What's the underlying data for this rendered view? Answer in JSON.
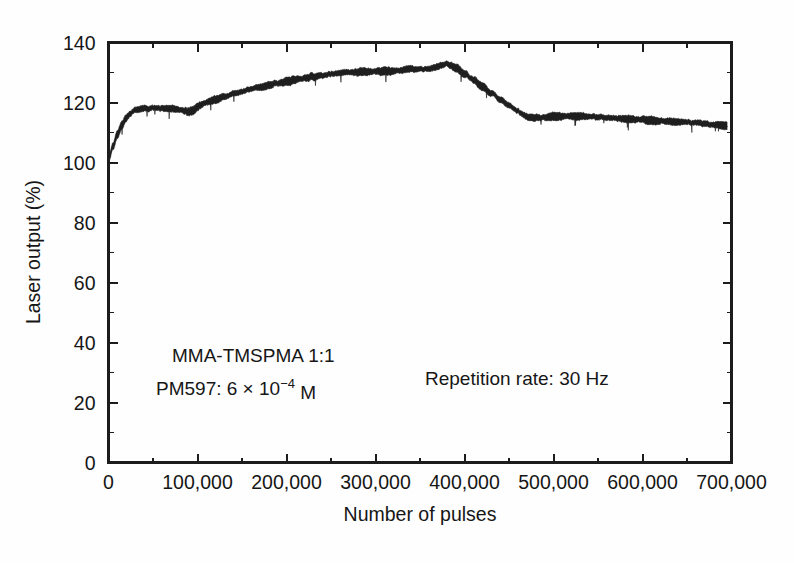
{
  "figure": {
    "background_color": "#fefefe",
    "ink_color": "#1c1c1c"
  },
  "chart_data": {
    "type": "line",
    "title": "",
    "xlabel": "Number of pulses",
    "ylabel": "Laser output (%)",
    "xlim": [
      0,
      700000
    ],
    "ylim": [
      0,
      140
    ],
    "grid": false,
    "legend": null,
    "x_ticks": [
      0,
      100000,
      200000,
      300000,
      400000,
      500000,
      600000,
      700000
    ],
    "x_tick_labels": [
      "0",
      "100,000",
      "200,000",
      "300,000",
      "400,000",
      "500,000",
      "600,000",
      "700,000"
    ],
    "x_minor_tick_step": 50000,
    "y_ticks": [
      0,
      20,
      40,
      60,
      80,
      100,
      120,
      140
    ],
    "y_tick_labels": [
      "0",
      "20",
      "40",
      "60",
      "80",
      "100",
      "120",
      "140"
    ],
    "y_minor_tick_step": 10,
    "series": [
      {
        "name": "Laser output vs pulses",
        "color": "#1f1f1f",
        "noise_amplitude": 1.4,
        "x": [
          0,
          5000,
          10000,
          15000,
          20000,
          25000,
          30000,
          40000,
          50000,
          60000,
          70000,
          80000,
          85000,
          90000,
          95000,
          100000,
          105000,
          110000,
          120000,
          130000,
          140000,
          150000,
          160000,
          170000,
          180000,
          190000,
          200000,
          210000,
          220000,
          230000,
          240000,
          250000,
          260000,
          270000,
          280000,
          290000,
          300000,
          310000,
          320000,
          330000,
          340000,
          350000,
          360000,
          370000,
          375000,
          380000,
          385000,
          390000,
          400000,
          410000,
          420000,
          430000,
          440000,
          450000,
          460000,
          465000,
          470000,
          480000,
          490000,
          500000,
          510000,
          520000,
          530000,
          540000,
          550000,
          560000,
          570000,
          580000,
          590000,
          600000,
          610000,
          620000,
          630000,
          640000,
          650000,
          660000,
          670000,
          680000,
          690000,
          695000
        ],
        "y": [
          101.0,
          105.5,
          109.5,
          112.5,
          114.8,
          116.5,
          117.6,
          118.0,
          118.2,
          118.1,
          117.9,
          117.6,
          117.2,
          116.9,
          117.3,
          118.6,
          119.4,
          120.0,
          121.0,
          122.0,
          122.9,
          123.7,
          124.5,
          125.1,
          125.8,
          126.4,
          127.0,
          127.6,
          128.1,
          128.6,
          129.0,
          129.4,
          129.8,
          130.0,
          130.2,
          130.3,
          130.4,
          130.3,
          130.5,
          130.9,
          131.2,
          131.0,
          131.3,
          131.8,
          132.4,
          132.9,
          132.3,
          131.4,
          129.7,
          127.6,
          125.3,
          123.1,
          121.0,
          119.0,
          117.1,
          116.0,
          115.2,
          114.9,
          115.0,
          115.2,
          115.4,
          115.5,
          115.4,
          115.3,
          115.2,
          115.0,
          114.8,
          114.6,
          114.4,
          114.2,
          114.0,
          113.8,
          113.6,
          113.5,
          113.4,
          113.2,
          113.0,
          112.7,
          112.3,
          112.0
        ]
      }
    ],
    "annotations": [
      {
        "name": "annotation-composition",
        "text": "MMA-TMSPMA 1:1",
        "x_px": 172,
        "y_px": 362
      },
      {
        "name": "annotation-dye-concentration",
        "text_prefix": "PM597: 6 × 10",
        "text_sup": "−4",
        "text_suffix": " M",
        "x_px": 156,
        "y_px": 395
      },
      {
        "name": "annotation-repetition-rate",
        "text": "Repetition rate: 30 Hz",
        "x_px": 425,
        "y_px": 385
      }
    ]
  }
}
